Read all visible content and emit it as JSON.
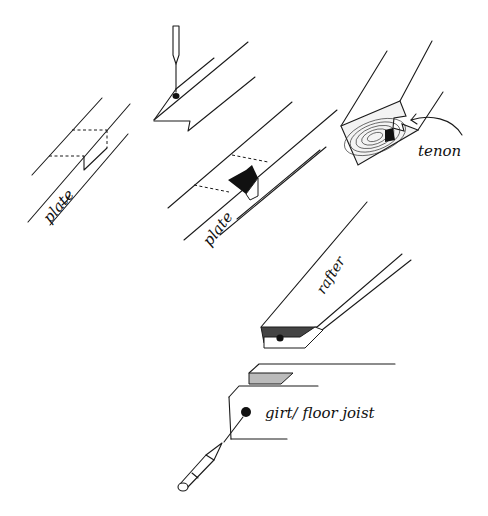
{
  "figure": {
    "labels": {
      "plate_left": "plate",
      "plate_center": "plate",
      "tenon": "tenon",
      "rafter": "rafter",
      "girt": "girt/ floor joist"
    },
    "colors": {
      "ink": "#1a1a1a",
      "background": "#ffffff"
    }
  }
}
